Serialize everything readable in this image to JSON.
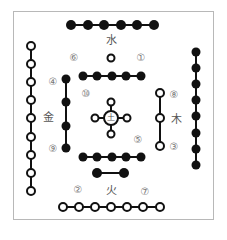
{
  "diagram": {
    "title": "",
    "colors": {
      "yin": "#111111",
      "yang_fill": "#ffffff",
      "stroke": "#111111",
      "frame": "#b8b8b8",
      "label": "#777777"
    },
    "elements": {
      "water": "水",
      "fire": "火",
      "wood": "木",
      "metal": "金",
      "earth": "土"
    },
    "numbers": {
      "n1": "①",
      "n2": "②",
      "n3": "③",
      "n4": "④",
      "n5": "⑤",
      "n6": "⑥",
      "n7": "⑦",
      "n8": "⑧",
      "n9": "⑨",
      "n10": "⑩"
    },
    "groups": [
      {
        "id": "north-outer",
        "number": 6,
        "type": "yin",
        "count": 6,
        "orientation": "horizontal"
      },
      {
        "id": "north-inner",
        "number": 1,
        "type": "yang",
        "count": 1
      },
      {
        "id": "center-top",
        "number": 10,
        "type": "yin",
        "count": 5,
        "orientation": "horizontal"
      },
      {
        "id": "center-bottom",
        "number": 10,
        "type": "yin",
        "count": 5,
        "orientation": "horizontal"
      },
      {
        "id": "center-cross",
        "number": 5,
        "type": "yang",
        "count": 5
      },
      {
        "id": "south-inner",
        "number": 2,
        "type": "yin",
        "count": 2,
        "orientation": "horizontal"
      },
      {
        "id": "south-outer",
        "number": 7,
        "type": "yang",
        "count": 7,
        "orientation": "horizontal"
      },
      {
        "id": "west-inner",
        "number": 4,
        "type": "yin",
        "count": 4,
        "orientation": "vertical"
      },
      {
        "id": "west-outer",
        "number": 9,
        "type": "yang",
        "count": 9,
        "orientation": "vertical"
      },
      {
        "id": "east-inner",
        "number": 3,
        "type": "yang",
        "count": 3,
        "orientation": "vertical"
      },
      {
        "id": "east-outer",
        "number": 8,
        "type": "yin",
        "count": 8,
        "orientation": "vertical"
      }
    ]
  }
}
